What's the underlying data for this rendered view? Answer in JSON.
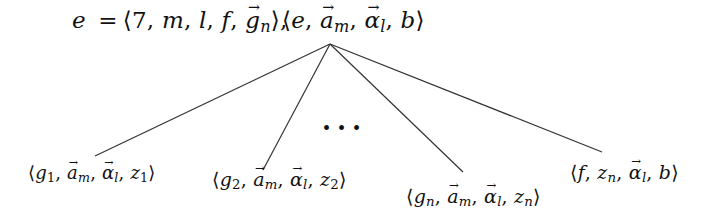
{
  "diagram": {
    "type": "tree",
    "top_left_equation": {
      "lhs": "e",
      "rhs_parts": [
        "7",
        "m",
        "l",
        "f",
        "g_n (vector)"
      ],
      "text": "e = ⟨7, m, l, f, g⃗ₙ⟩,"
    },
    "root": {
      "text": "⟨e, a⃗ₘ, α⃗ₗ, b⟩",
      "parts": [
        "e",
        "a_m (vector)",
        "alpha_l (vector)",
        "b"
      ]
    },
    "children": [
      {
        "text": "⟨g₁, a⃗ₘ, α⃗ₗ, z₁⟩",
        "parts": [
          "g_1",
          "a_m (vector)",
          "alpha_l (vector)",
          "z_1"
        ]
      },
      {
        "text": "⟨g₂, a⃗ₘ, α⃗ₗ, z₂⟩",
        "parts": [
          "g_2",
          "a_m (vector)",
          "alpha_l (vector)",
          "z_2"
        ]
      },
      {
        "text": "⟨gₙ, a⃗ₘ, α⃗ₗ, zₙ⟩",
        "parts": [
          "g_n",
          "a_m (vector)",
          "alpha_l (vector)",
          "z_n"
        ]
      },
      {
        "text": "⟨f, zₙ, α⃗ₗ, b⟩",
        "parts": [
          "f",
          "z_n",
          "alpha_l (vector)",
          "b"
        ]
      }
    ],
    "ellipsis": "...",
    "edges": [
      {
        "from": "root",
        "to": "child-1"
      },
      {
        "from": "root",
        "to": "child-2"
      },
      {
        "from": "root",
        "to": "child-n"
      },
      {
        "from": "root",
        "to": "child-f"
      }
    ],
    "line_color": "#333333",
    "text_color": "#111111"
  },
  "sym": {
    "lang": "⟨",
    "rang": "⟩",
    "comma": ",",
    "eq": "=",
    "e": "e",
    "seven": "7",
    "m": "m",
    "l": "l",
    "f": "f",
    "g": "g",
    "a": "a",
    "alpha": "α",
    "b": "b",
    "z": "z",
    "n": "n",
    "one": "1",
    "two": "2",
    "dots": "..."
  }
}
